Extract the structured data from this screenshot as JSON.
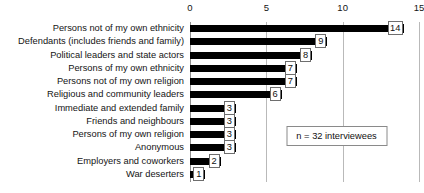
{
  "chart_data": {
    "type": "bar",
    "orientation": "horizontal",
    "title": "",
    "xlabel": "",
    "ylabel": "",
    "xlim": [
      0,
      15
    ],
    "xticks": [
      0,
      5,
      10,
      15
    ],
    "grid": true,
    "legend": false,
    "bar_color": "#000000",
    "categories": [
      "Persons not of my own ethnicity",
      "Defendants (includes friends and family)",
      "Political leaders and state actors",
      "Persons of my own ethnicity",
      "Persons not of my own religion",
      "Religious and community leaders",
      "Immediate and extended family",
      "Friends and neighbours",
      "Persons of my own religion",
      "Anonymous",
      "Employers and coworkers",
      "War deserters"
    ],
    "values": [
      14,
      9,
      8,
      7,
      7,
      6,
      3,
      3,
      3,
      3,
      2,
      1
    ],
    "data_labels": [
      "14",
      "9",
      "8",
      "7",
      "7",
      "6",
      "3",
      "3",
      "3",
      "3",
      "2",
      "1"
    ],
    "annotations": [
      {
        "text": "n = 32 interviewees",
        "x": 9.6,
        "y_row": 8
      }
    ]
  },
  "colors": {
    "bar": "#000000",
    "gridline": "#b9b9b9",
    "axis": "#8f8f8f",
    "box_border": "#6e6e6e",
    "text": "#141414",
    "background": "#ffffff"
  }
}
